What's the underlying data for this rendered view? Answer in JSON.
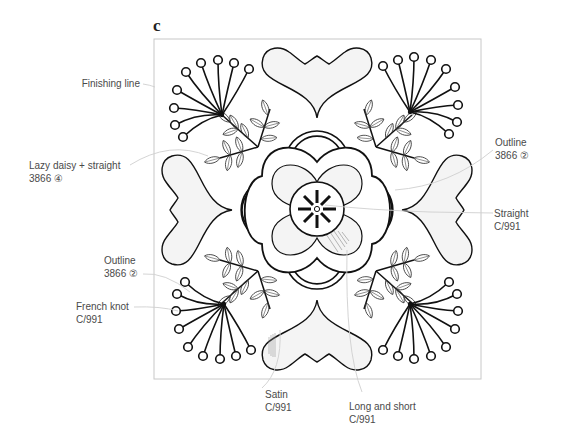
{
  "figure": {
    "panel_letter": "c",
    "frame": {
      "x": 154,
      "y": 39,
      "width": 327,
      "height": 340,
      "stroke": "#c8c8c8"
    },
    "colors": {
      "line": "#111111",
      "leader": "#cfcfcf",
      "fill": "#f4f4f4",
      "label_text": "#4a4a4a"
    }
  },
  "labels": {
    "finishing_line": {
      "line1": "Finishing line",
      "line2": ""
    },
    "lazy_daisy": {
      "line1": "Lazy daisy + straight",
      "line2": "3866 ④"
    },
    "outline_left": {
      "line1": "Outline",
      "line2": "3866 ②"
    },
    "french_knot": {
      "line1": "French knot",
      "line2": "C/991"
    },
    "outline_right": {
      "line1": "Outline",
      "line2": "3866 ②"
    },
    "straight": {
      "line1": "Straight",
      "line2": "C/991"
    },
    "satin": {
      "line1": "Satin",
      "line2": "C/991"
    },
    "long_and_short": {
      "line1": "Long and short",
      "line2": "C/991"
    }
  }
}
